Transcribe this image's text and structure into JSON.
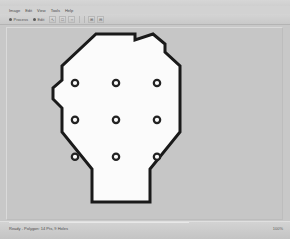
{
  "window": {
    "title": ""
  },
  "menu": {
    "items": [
      {
        "label": "Image",
        "name": "menu-image"
      },
      {
        "label": "Edit",
        "name": "menu-edit"
      },
      {
        "label": "View",
        "name": "menu-view"
      },
      {
        "label": "Tools",
        "name": "menu-tools"
      },
      {
        "label": "Help",
        "name": "menu-help"
      }
    ]
  },
  "toolbar": {
    "radios": [
      {
        "label": "Process",
        "name": "radio-process",
        "selected": true
      },
      {
        "label": "Edit",
        "name": "radio-edit",
        "selected": true
      }
    ],
    "buttons": [
      {
        "glyph": "↖",
        "name": "select-tool-button"
      },
      {
        "glyph": "□",
        "name": "rectangle-tool-button"
      },
      {
        "glyph": "○",
        "name": "ellipse-tool-button"
      }
    ],
    "buttons_right": [
      {
        "glyph": "⊞",
        "name": "zoom-in-button"
      },
      {
        "glyph": "⊟",
        "name": "zoom-out-button"
      }
    ]
  },
  "canvas": {
    "background_color": "#c6c6c6",
    "shape": {
      "name": "hexagonal-plate",
      "fill_color": "#fbfbfb",
      "stroke_color": "#1a1a1a",
      "stroke_width": 3
    },
    "holes": {
      "count": 9,
      "rows": 3,
      "cols": 3,
      "fill_color": "#fbfbfb",
      "stroke_color": "#222222",
      "radius": 3.2,
      "positions": [
        {
          "x": 0.2455,
          "y": 0.285
        },
        {
          "x": 0.3935,
          "y": 0.285
        },
        {
          "x": 0.5415,
          "y": 0.285
        },
        {
          "x": 0.2455,
          "y": 0.476
        },
        {
          "x": 0.3935,
          "y": 0.476
        },
        {
          "x": 0.5415,
          "y": 0.476
        },
        {
          "x": 0.2455,
          "y": 0.667
        },
        {
          "x": 0.3935,
          "y": 0.667
        },
        {
          "x": 0.5415,
          "y": 0.667
        }
      ]
    }
  },
  "status": {
    "message": "Ready - Polygon: 14 Pts, 9 Holes",
    "right": "100%"
  }
}
